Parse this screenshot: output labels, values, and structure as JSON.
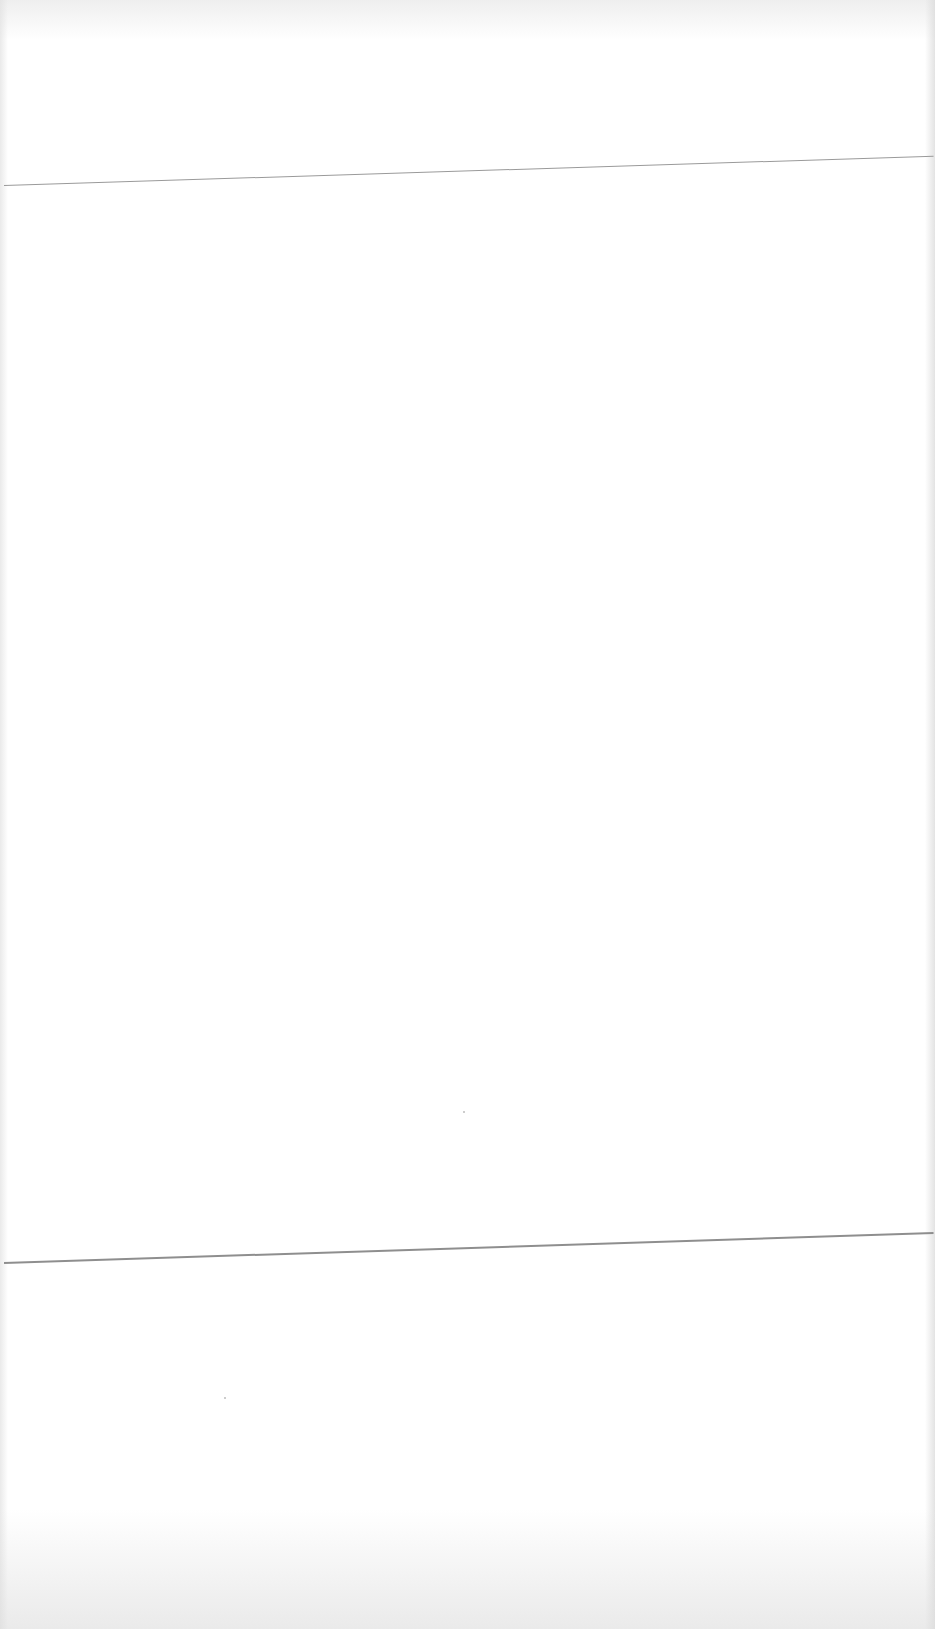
{
  "document": {
    "type": "scanned-blank-page",
    "text_content": "",
    "rules": [
      {
        "name": "top-rule",
        "approx_y": 165
      },
      {
        "name": "bottom-rule",
        "approx_y": 1245
      }
    ]
  }
}
